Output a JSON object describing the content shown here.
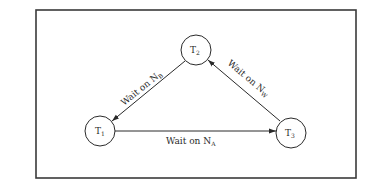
{
  "diagram": {
    "type": "wait-for graph (deadlock cycle)",
    "frame": {
      "x": 36,
      "y": 10,
      "width": 320,
      "height": 168
    },
    "colors": {
      "stroke": "#2a2a2a",
      "background": "#ffffff"
    },
    "nodes": [
      {
        "id": "T1",
        "base": "T",
        "sub": "1",
        "cx": 100,
        "cy": 131,
        "r": 15
      },
      {
        "id": "T2",
        "base": "T",
        "sub": "2",
        "cx": 196,
        "cy": 50,
        "r": 15
      },
      {
        "id": "T3",
        "base": "T",
        "sub": "3",
        "cx": 291,
        "cy": 133,
        "r": 15
      }
    ],
    "edges": [
      {
        "from": "T2",
        "to": "T1",
        "label_base": "Wait on N",
        "label_sub": "B"
      },
      {
        "from": "T3",
        "to": "T2",
        "label_base": "Wait on N",
        "label_sub": "W"
      },
      {
        "from": "T1",
        "to": "T3",
        "label_base": "Wait on N",
        "label_sub": "A"
      }
    ]
  }
}
